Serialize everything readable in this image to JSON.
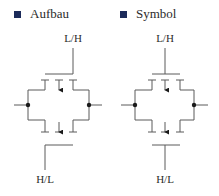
{
  "legend": [
    {
      "label": "Aufbau",
      "color": "#1c2b5a"
    },
    {
      "label": "Symbol",
      "color": "#1c2b5a"
    }
  ],
  "diagrams": [
    {
      "name": "Aufbau",
      "top_label": "L/H",
      "bottom_label": "H/L"
    },
    {
      "name": "Symbol",
      "top_label": "L/H",
      "bottom_label": "H/L"
    }
  ],
  "colors": {
    "line": "#5a5a5a",
    "dot": "#1a1a1a",
    "text": "#2b2b2b"
  }
}
